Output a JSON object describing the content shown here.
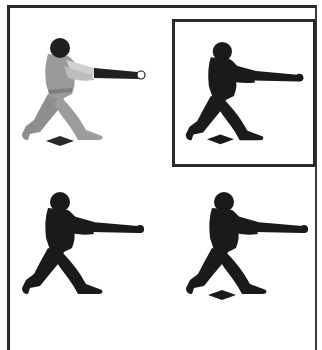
{
  "panels": [
    {
      "id": "color-batter",
      "style": "color",
      "has_plate": true,
      "highlighted": false
    },
    {
      "id": "silhouette-batter-plate",
      "style": "silhouette",
      "has_plate": true,
      "highlighted": true
    },
    {
      "id": "silhouette-batter",
      "style": "silhouette",
      "has_plate": false,
      "highlighted": false
    },
    {
      "id": "silhouette-batter-plate-2",
      "style": "silhouette",
      "has_plate": true,
      "highlighted": false
    }
  ],
  "colors": {
    "border": "#2a2a2a",
    "silhouette": "#1a1a1a",
    "uniform": "#9a9a9a",
    "uniform_shadow": "#7d7d7d",
    "helmet": "#1e1e1e",
    "skin": "#c8c8c8",
    "bat": "#202020",
    "plate": "#2a2a2a"
  }
}
